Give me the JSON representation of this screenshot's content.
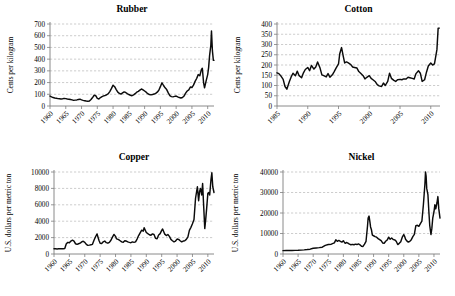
{
  "figure": {
    "background": "#ffffff",
    "line_color": "#0b0b0b",
    "grid_color": "#9a9a9a",
    "axis_color": "#7d7d7d"
  },
  "panels": [
    {
      "id": "rubber",
      "title": "Rubber",
      "ylabel": "Cents per kilogram",
      "xticks": [
        "1960",
        "1965",
        "1970",
        "1975",
        "1980",
        "1985",
        "1990",
        "1995",
        "2000",
        "2005",
        "2010"
      ],
      "yticks": [
        "0",
        "100",
        "200",
        "300",
        "400",
        "500",
        "600",
        "700"
      ]
    },
    {
      "id": "cotton",
      "title": "Cotton",
      "ylabel": "Cents per kilogram",
      "xticks": [
        "1985",
        "1990",
        "1995",
        "2000",
        "2005",
        "2010"
      ],
      "yticks": [
        "0",
        "50",
        "100",
        "150",
        "200",
        "250",
        "300",
        "350",
        "400"
      ]
    },
    {
      "id": "copper",
      "title": "Copper",
      "ylabel": "U.S. dollars per metric ton",
      "xticks": [
        "1960",
        "1965",
        "1970",
        "1975",
        "1980",
        "1985",
        "1990",
        "1995",
        "2000",
        "2005",
        "2010"
      ],
      "yticks": [
        "0",
        "2000",
        "4000",
        "6000",
        "8000",
        "10000"
      ]
    },
    {
      "id": "nickel",
      "title": "Nickel",
      "ylabel": "U.S. dollars per metric ton",
      "xticks": [
        "1960",
        "1965",
        "1970",
        "1975",
        "1980",
        "1985",
        "1990",
        "1995",
        "2000",
        "2005",
        "2010"
      ],
      "yticks": [
        "0",
        "10000",
        "20000",
        "30000",
        "40000"
      ]
    }
  ],
  "chart_data": [
    {
      "type": "line",
      "id": "rubber",
      "title": "Rubber",
      "xlabel": "",
      "ylabel": "Cents per kilogram",
      "xlim": [
        1960,
        2012
      ],
      "ylim": [
        0,
        700
      ],
      "grid": true,
      "legend": "none",
      "xticks": [
        1960,
        1965,
        1970,
        1975,
        1980,
        1985,
        1990,
        1995,
        2000,
        2005,
        2010
      ],
      "yticks": [
        0,
        100,
        200,
        300,
        400,
        500,
        600,
        700
      ],
      "series": [
        {
          "name": "Rubber price",
          "x": [
            1960,
            1960.5,
            1961,
            1961.5,
            1962,
            1962.5,
            1963,
            1963.5,
            1964,
            1964.5,
            1965,
            1965.5,
            1966,
            1966.5,
            1967,
            1967.5,
            1968,
            1968.5,
            1969,
            1969.5,
            1970,
            1970.5,
            1971,
            1971.5,
            1972,
            1972.5,
            1973,
            1973.5,
            1974,
            1974.5,
            1975,
            1975.5,
            1976,
            1976.5,
            1977,
            1977.5,
            1978,
            1978.5,
            1979,
            1979.5,
            1980,
            1980.5,
            1981,
            1981.5,
            1982,
            1982.5,
            1983,
            1983.5,
            1984,
            1984.5,
            1985,
            1985.5,
            1986,
            1986.5,
            1987,
            1987.5,
            1988,
            1988.5,
            1989,
            1989.5,
            1990,
            1990.5,
            1991,
            1991.5,
            1992,
            1992.5,
            1993,
            1993.5,
            1994,
            1994.5,
            1995,
            1995.5,
            1996,
            1996.5,
            1997,
            1997.5,
            1998,
            1998.5,
            1999,
            1999.5,
            2000,
            2000.5,
            2001,
            2001.5,
            2002,
            2002.5,
            2003,
            2003.5,
            2004,
            2004.5,
            2005,
            2005.5,
            2006,
            2006.5,
            2007,
            2007.5,
            2008,
            2008.3,
            2008.7,
            2009,
            2009.5,
            2010,
            2010.3,
            2010.6,
            2011,
            2011.2,
            2011.5,
            2011.8,
            2012
          ],
          "y": [
            85,
            78,
            72,
            68,
            66,
            63,
            62,
            60,
            62,
            65,
            63,
            60,
            58,
            55,
            52,
            48,
            50,
            52,
            55,
            58,
            52,
            48,
            45,
            42,
            40,
            42,
            55,
            72,
            92,
            88,
            65,
            60,
            72,
            80,
            86,
            90,
            96,
            105,
            125,
            150,
            178,
            165,
            140,
            118,
            108,
            102,
            112,
            120,
            115,
            105,
            98,
            92,
            88,
            95,
            105,
            118,
            125,
            135,
            145,
            138,
            128,
            118,
            105,
            98,
            95,
            98,
            102,
            108,
            118,
            135,
            165,
            198,
            175,
            155,
            140,
            112,
            88,
            80,
            78,
            82,
            85,
            78,
            72,
            68,
            72,
            85,
            110,
            128,
            138,
            162,
            158,
            178,
            210,
            235,
            268,
            258,
            310,
            322,
            200,
            155,
            215,
            268,
            330,
            430,
            520,
            640,
            470,
            390,
            390
          ]
        }
      ]
    },
    {
      "type": "line",
      "id": "cotton",
      "title": "Cotton",
      "xlabel": "",
      "ylabel": "Cents per kilogram",
      "xlim": [
        1985,
        2011.5
      ],
      "ylim": [
        0,
        400
      ],
      "grid": true,
      "legend": "none",
      "xticks": [
        1985,
        1990,
        1995,
        2000,
        2005,
        2010
      ],
      "yticks": [
        0,
        50,
        100,
        150,
        200,
        250,
        300,
        350,
        400
      ],
      "series": [
        {
          "name": "Cotton price",
          "x": [
            1985,
            1985.3,
            1985.6,
            1986,
            1986.3,
            1986.6,
            1987,
            1987.3,
            1987.6,
            1988,
            1988.3,
            1988.6,
            1989,
            1989.3,
            1989.6,
            1990,
            1990.3,
            1990.6,
            1991,
            1991.3,
            1991.6,
            1992,
            1992.3,
            1992.6,
            1993,
            1993.3,
            1993.6,
            1994,
            1994.3,
            1994.6,
            1995,
            1995.2,
            1995.5,
            1995.8,
            1996,
            1996.3,
            1996.6,
            1997,
            1997.3,
            1997.6,
            1998,
            1998.3,
            1998.6,
            1999,
            1999.3,
            1999.6,
            2000,
            2000.3,
            2000.6,
            2001,
            2001.3,
            2001.6,
            2002,
            2002.3,
            2002.6,
            2003,
            2003.3,
            2003.6,
            2004,
            2004.3,
            2004.6,
            2005,
            2005.3,
            2005.6,
            2006,
            2006.3,
            2006.6,
            2007,
            2007.3,
            2007.6,
            2008,
            2008.3,
            2008.6,
            2009,
            2009.3,
            2009.6,
            2010,
            2010.3,
            2010.6,
            2011,
            2011.2,
            2011.4
          ],
          "y": [
            162,
            158,
            148,
            130,
            95,
            82,
            118,
            142,
            160,
            148,
            170,
            148,
            138,
            162,
            178,
            188,
            172,
            198,
            180,
            190,
            215,
            185,
            152,
            148,
            142,
            158,
            140,
            152,
            168,
            185,
            205,
            255,
            285,
            238,
            210,
            215,
            210,
            202,
            190,
            188,
            185,
            168,
            160,
            148,
            132,
            140,
            148,
            135,
            128,
            118,
            104,
            98,
            95,
            112,
            100,
            120,
            160,
            135,
            125,
            120,
            128,
            130,
            128,
            132,
            132,
            140,
            138,
            135,
            132,
            158,
            172,
            160,
            120,
            128,
            165,
            195,
            210,
            200,
            205,
            275,
            380,
            380
          ]
        }
      ]
    },
    {
      "type": "line",
      "id": "copper",
      "title": "Copper",
      "xlabel": "",
      "ylabel": "U.S. dollars per metric ton",
      "xlim": [
        1960,
        2012
      ],
      "ylim": [
        0,
        10000
      ],
      "grid": true,
      "legend": "none",
      "xticks": [
        1960,
        1965,
        1970,
        1975,
        1980,
        1985,
        1990,
        1995,
        2000,
        2005,
        2010
      ],
      "yticks": [
        0,
        2000,
        4000,
        6000,
        8000,
        10000
      ],
      "series": [
        {
          "name": "Copper price",
          "x": [
            1960,
            1960.5,
            1961,
            1961.5,
            1962,
            1962.5,
            1963,
            1963.5,
            1964,
            1964.5,
            1965,
            1965.5,
            1966,
            1966.5,
            1967,
            1967.5,
            1968,
            1968.5,
            1969,
            1969.5,
            1970,
            1970.5,
            1971,
            1971.5,
            1972,
            1972.5,
            1973,
            1973.5,
            1974,
            1974.3,
            1974.6,
            1975,
            1975.5,
            1976,
            1976.5,
            1977,
            1977.5,
            1978,
            1978.5,
            1979,
            1979.5,
            1980,
            1980.3,
            1980.6,
            1981,
            1981.5,
            1982,
            1982.5,
            1983,
            1983.5,
            1984,
            1984.5,
            1985,
            1985.5,
            1986,
            1986.5,
            1987,
            1987.5,
            1988,
            1988.5,
            1989,
            1989.3,
            1989.6,
            1990,
            1990.5,
            1991,
            1991.5,
            1992,
            1992.5,
            1993,
            1993.5,
            1994,
            1994.5,
            1995,
            1995.3,
            1995.6,
            1996,
            1996.5,
            1997,
            1997.5,
            1998,
            1998.5,
            1999,
            1999.5,
            2000,
            2000.5,
            2001,
            2001.5,
            2002,
            2002.5,
            2003,
            2003.5,
            2004,
            2004.5,
            2005,
            2005.5,
            2006,
            2006.3,
            2006.6,
            2007,
            2007.3,
            2007.6,
            2008,
            2008.3,
            2008.6,
            2009,
            2009.3,
            2009.6,
            2010,
            2010.3,
            2010.6,
            2011,
            2011.3,
            2011.6,
            2012
          ],
          "y": [
            640,
            630,
            620,
            635,
            645,
            655,
            650,
            660,
            1250,
            1420,
            1380,
            1580,
            1680,
            1560,
            1250,
            1180,
            1250,
            1320,
            1480,
            1560,
            1420,
            1180,
            1050,
            1080,
            1120,
            1180,
            1680,
            2100,
            2450,
            2050,
            1680,
            1320,
            1280,
            1480,
            1580,
            1380,
            1320,
            1420,
            1680,
            2050,
            2380,
            2150,
            1850,
            1820,
            1750,
            1620,
            1480,
            1420,
            1620,
            1580,
            1480,
            1420,
            1380,
            1480,
            1420,
            1480,
            1820,
            2250,
            2580,
            2900,
            2780,
            3200,
            2950,
            2620,
            2480,
            2350,
            2280,
            2450,
            2380,
            1920,
            1850,
            2320,
            2480,
            2880,
            3050,
            2780,
            2420,
            2250,
            2380,
            2150,
            1780,
            1620,
            1480,
            1580,
            1820,
            1780,
            1620,
            1480,
            1580,
            1620,
            1780,
            2050,
            2880,
            3250,
            3680,
            4200,
            6800,
            7500,
            8200,
            6500,
            7600,
            8000,
            7200,
            8600,
            6200,
            3100,
            4200,
            5500,
            7400,
            7500,
            7200,
            9000,
            9900,
            8200,
            7500,
            7500
          ]
        }
      ]
    },
    {
      "type": "line",
      "id": "nickel",
      "title": "Nickel",
      "xlabel": "",
      "ylabel": "U.S. dollars per metric ton",
      "xlim": [
        1960,
        2012
      ],
      "ylim": [
        0,
        40000
      ],
      "grid": true,
      "legend": "none",
      "xticks": [
        1960,
        1965,
        1970,
        1975,
        1980,
        1985,
        1990,
        1995,
        2000,
        2005,
        2010
      ],
      "yticks": [
        0,
        10000,
        20000,
        30000,
        40000
      ],
      "series": [
        {
          "name": "Nickel price",
          "x": [
            1960,
            1961,
            1962,
            1963,
            1964,
            1965,
            1966,
            1967,
            1968,
            1969,
            1970,
            1971,
            1972,
            1973,
            1974,
            1975,
            1976,
            1977,
            1977.5,
            1978,
            1978.5,
            1979,
            1979.5,
            1980,
            1980.3,
            1980.6,
            1981,
            1981.5,
            1982,
            1982.5,
            1983,
            1983.5,
            1984,
            1984.5,
            1985,
            1985.5,
            1986,
            1986.5,
            1987,
            1987.5,
            1988,
            1988.2,
            1988.5,
            1988.8,
            1989,
            1989.3,
            1989.6,
            1990,
            1990.5,
            1991,
            1991.5,
            1992,
            1992.5,
            1993,
            1993.5,
            1994,
            1994.5,
            1995,
            1995.5,
            1996,
            1996.5,
            1997,
            1997.5,
            1998,
            1998.5,
            1999,
            1999.5,
            2000,
            2000.3,
            2000.6,
            2001,
            2001.5,
            2002,
            2002.5,
            2003,
            2003.5,
            2004,
            2004.5,
            2005,
            2005.5,
            2006,
            2006.5,
            2007,
            2007.2,
            2007.4,
            2007.6,
            2008,
            2008.3,
            2008.6,
            2009,
            2009.3,
            2009.6,
            2010,
            2010.3,
            2010.6,
            2011,
            2011.3,
            2011.6,
            2012
          ],
          "y": [
            1650,
            1700,
            1720,
            1750,
            1780,
            1820,
            1900,
            2000,
            2150,
            2350,
            2800,
            2950,
            3100,
            3300,
            4200,
            4600,
            4800,
            5400,
            6900,
            6200,
            6600,
            6200,
            5800,
            6500,
            5800,
            5200,
            5600,
            5300,
            4800,
            4500,
            4700,
            4500,
            4800,
            4600,
            4900,
            4500,
            3800,
            3700,
            4800,
            6200,
            13800,
            17500,
            18500,
            15500,
            13200,
            11800,
            9200,
            8900,
            8500,
            8200,
            7500,
            7000,
            6500,
            5400,
            5200,
            6200,
            6800,
            8200,
            7200,
            7800,
            7100,
            6900,
            6200,
            4600,
            5200,
            6000,
            8200,
            9500,
            8500,
            7200,
            6400,
            5800,
            6200,
            7000,
            8500,
            9600,
            13800,
            14000,
            13500,
            14800,
            16000,
            24000,
            34000,
            40000,
            38000,
            32000,
            29000,
            21000,
            14000,
            9500,
            12500,
            17500,
            20500,
            24000,
            22000,
            25000,
            28000,
            22000,
            17500
          ]
        }
      ]
    }
  ]
}
